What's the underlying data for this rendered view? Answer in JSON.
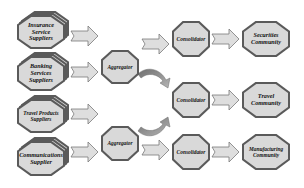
{
  "diagram": {
    "suppliers": [
      {
        "label": "Insurance\nService\nSuppliers"
      },
      {
        "label": "Banking\nServices\nSuppliers"
      },
      {
        "label": "Travel Products\nSuppliers"
      },
      {
        "label": "Communications\nSupplier"
      }
    ],
    "aggregators": [
      {
        "label": "Aggregator"
      },
      {
        "label": "Aggregator"
      }
    ],
    "consolidators": [
      {
        "label": "Consolidator"
      },
      {
        "label": "Consolidator"
      },
      {
        "label": "Consolidator"
      }
    ],
    "communities": [
      {
        "label": "Securities\nCommunity"
      },
      {
        "label": "Travel\nCommunity"
      },
      {
        "label": "Manufacturing\nCommunity"
      }
    ],
    "colors": {
      "node_fill": "#d9d9d9",
      "node_border": "#5a5a5a",
      "arrow_fill": "#dedede",
      "arrow_stroke": "#7a7a7a",
      "curved_arrow_fill": "#8a8a8a"
    }
  }
}
